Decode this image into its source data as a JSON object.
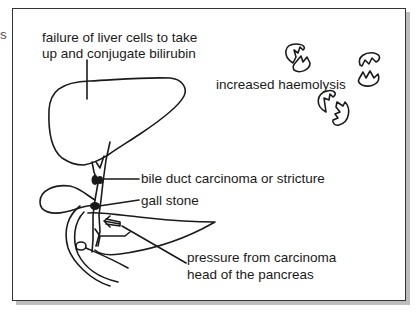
{
  "cutoff_text": "s",
  "labels": {
    "liver_line1": "failure of liver cells to take",
    "liver_line2": "up and conjugate bilirubin",
    "haemolysis": "increased haemolysis",
    "bile_duct": "bile duct carcinoma or stricture",
    "gall_stone": "gall stone",
    "pancreas_line1": "pressure from carcinoma",
    "pancreas_line2": "head of the pancreas"
  },
  "colors": {
    "stroke": "#1a1a1a",
    "frame": "#333333",
    "shadow": "#bdbdbd"
  }
}
